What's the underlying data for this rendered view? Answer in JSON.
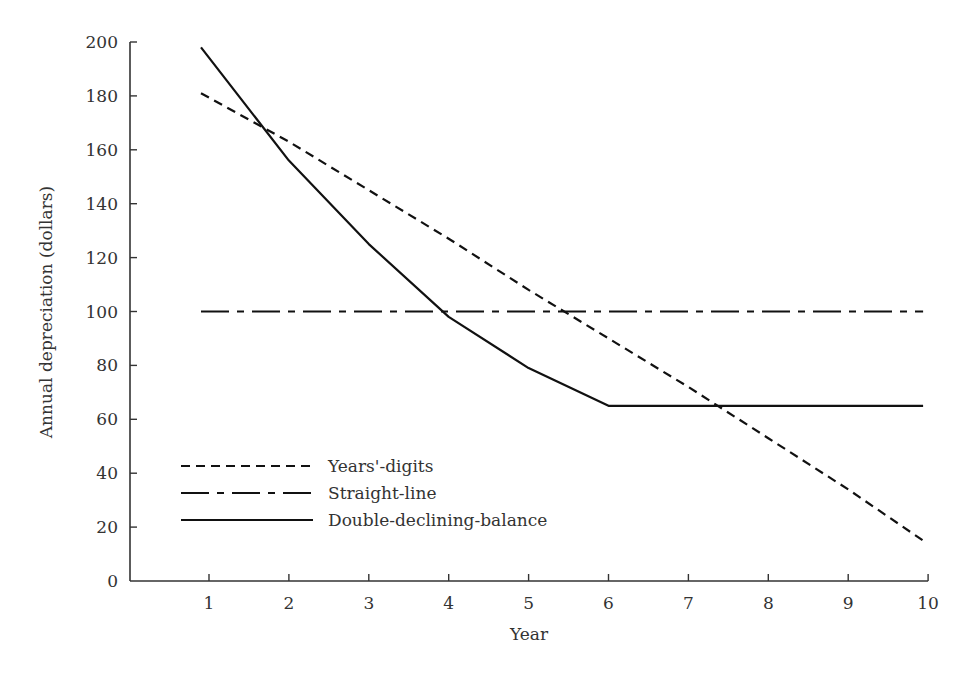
{
  "chart_data": {
    "type": "line",
    "title": "",
    "xlabel": "Year",
    "ylabel": "Annual depreciation (dollars)",
    "x": [
      1,
      2,
      3,
      4,
      5,
      6,
      7,
      8,
      9,
      10
    ],
    "x_ticks": [
      "1",
      "2",
      "3",
      "4",
      "5",
      "6",
      "7",
      "8",
      "9",
      "10"
    ],
    "y_ticks": [
      "0",
      "20",
      "40",
      "60",
      "80",
      "100",
      "120",
      "140",
      "160",
      "180",
      "200"
    ],
    "ylim": [
      0,
      200
    ],
    "xlim": [
      0,
      10
    ],
    "grid": false,
    "legend_position": "lower-left inside",
    "series": [
      {
        "name": "Years'-digits",
        "style": "dashed",
        "values": [
          181,
          163,
          145,
          127,
          108,
          90,
          72,
          53,
          34,
          15
        ]
      },
      {
        "name": "Straight-line",
        "style": "dash-dot",
        "values": [
          100,
          100,
          100,
          100,
          100,
          100,
          100,
          100,
          100,
          100
        ]
      },
      {
        "name": "Double-declining-balance",
        "style": "solid",
        "values": [
          198,
          156,
          125,
          98,
          79,
          65,
          65,
          65,
          65,
          65
        ]
      }
    ]
  },
  "colors": {
    "line": "#111111",
    "axis": "#333333",
    "text": "#333333"
  }
}
